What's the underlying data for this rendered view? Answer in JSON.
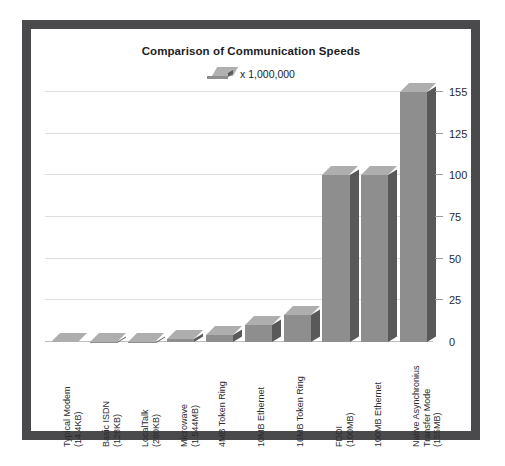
{
  "chart_data": {
    "type": "bar",
    "title": "Comparison of Communication Speeds",
    "subtitle": "",
    "xlabel": "",
    "ylabel": "",
    "legend": [
      {
        "label": "x 1,000,000",
        "swatch_color": "#8e8e8e"
      }
    ],
    "legend_position": "top-center",
    "grid": true,
    "ylim": [
      0,
      155
    ],
    "yticks": [
      0,
      25,
      50,
      75,
      100,
      125,
      155
    ],
    "ytick_labels": [
      "0",
      "25",
      "50",
      "75",
      "100",
      "125",
      "155"
    ],
    "categories": [
      "Typical Modem\n(14.4KB)",
      "Basic ISDN\n(128KB)",
      "LocalTalk\n(280KB)",
      "Microwave\n(1.544MB)",
      "4MB Token Ring",
      "10MB Ethernet",
      "16MB Token Ring",
      "FDDI\n(100MB)",
      "100MB Ethernet",
      "Native Asynchronius\nTransfer Mode\n(155MB)"
    ],
    "category_lines": [
      [
        "Typical Modem",
        "(14.4KB)"
      ],
      [
        "Basic ISDN",
        "(128KB)"
      ],
      [
        "LocalTalk",
        "(280KB)"
      ],
      [
        "Microwave",
        "(1.544MB)"
      ],
      [
        "4MB Token Ring"
      ],
      [
        "10MB Ethernet"
      ],
      [
        "16MB Token Ring"
      ],
      [
        "FDDI",
        "(100MB)"
      ],
      [
        "100MB Ethernet"
      ],
      [
        "Native Asynchronius",
        "Transfer Mode",
        "(155MB)"
      ]
    ],
    "values": [
      0.0144,
      0.128,
      0.28,
      1.544,
      4,
      10,
      16,
      100,
      100,
      155
    ],
    "unit": "x 1,000,000 bits per second",
    "colors": {
      "bar_front": "#8e8e8e",
      "bar_side": "#595959",
      "bar_top": "#aeaeae",
      "gridline": "#dedede",
      "frame": "#4a4a4d",
      "background": "#ffffff",
      "text": "#1d1d1f"
    }
  }
}
